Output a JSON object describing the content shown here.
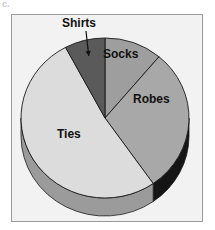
{
  "figure": {
    "caption_artifact": "c.",
    "background_color": "#ffffff",
    "frame": {
      "fill": "#f2f2f2",
      "border_color": "#9a9a9a"
    }
  },
  "chart_data": {
    "type": "pie",
    "title": "",
    "subtitle": "",
    "xlabel": "",
    "ylabel": "",
    "three_d": true,
    "legend_position": "none",
    "labels_position": "on-slice",
    "categories": [
      "Socks",
      "Robes",
      "Ties",
      "Shirts"
    ],
    "values": [
      11,
      29,
      52,
      8
    ],
    "units": "percent",
    "slices": [
      {
        "name": "Socks",
        "label": "Socks",
        "value": 11,
        "start_angle_deg": 0,
        "end_angle_deg": 40,
        "color": "#9e9e9e",
        "side_color": "#6f6f6f",
        "label_outside": false
      },
      {
        "name": "Robes",
        "label": "Robes",
        "value": 29,
        "start_angle_deg": 40,
        "end_angle_deg": 145,
        "color": "#a8a8a8",
        "side_color": "#151515",
        "label_outside": false
      },
      {
        "name": "Ties",
        "label": "Ties",
        "value": 52,
        "start_angle_deg": 145,
        "end_angle_deg": 332,
        "color": "#dcdcdc",
        "side_color": "#9b9b9b",
        "label_outside": false
      },
      {
        "name": "Shirts",
        "label": "Shirts",
        "value": 8,
        "start_angle_deg": 332,
        "end_angle_deg": 360,
        "color": "#5a5a5a",
        "side_color": "#3a3a3a",
        "label_outside": true,
        "leader_line": true
      }
    ],
    "geometry": {
      "center_x": 105,
      "center_y": 118,
      "radius_x": 84,
      "radius_y": 80,
      "depth": 18
    },
    "colors": {
      "socks": "#9e9e9e",
      "robes": "#a8a8a8",
      "ties": "#dcdcdc",
      "shirts": "#5a5a5a",
      "outline": "#1a1a1a"
    }
  }
}
